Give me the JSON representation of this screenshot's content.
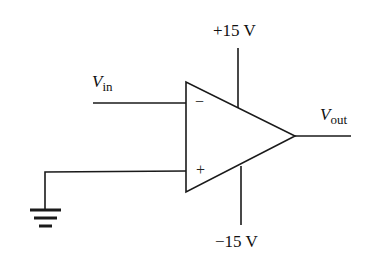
{
  "diagram": {
    "type": "op-amp circuit",
    "labels": {
      "vin_main": "V",
      "vin_sub": "in",
      "vout_main": "V",
      "vout_sub": "out",
      "supply_pos": "+15 V",
      "supply_neg": "−15 V",
      "inverting_sign": "−",
      "noninverting_sign": "+"
    },
    "components": [
      "op-amp",
      "ground"
    ],
    "connections": [
      "V_in to inverting (−) input",
      "non-inverting (+) input to ground",
      "+15 V to positive supply",
      "−15 V to negative supply",
      "output to V_out"
    ],
    "stroke_color": "#1a1a1a"
  }
}
